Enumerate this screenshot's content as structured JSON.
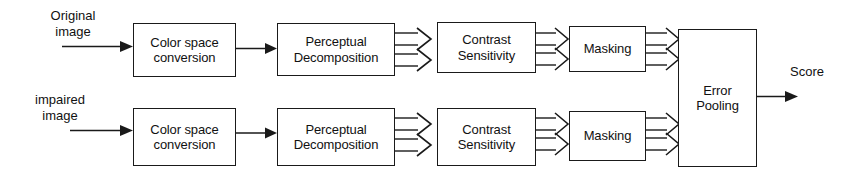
{
  "diagram": {
    "type": "flowchart",
    "background_color": "#ffffff",
    "line_color": "#1a1a1a",
    "text_color": "#111111",
    "inputs": [
      {
        "id": "original",
        "line1": "Original",
        "line2": "image"
      },
      {
        "id": "impaired",
        "line1": "impaired",
        "line2": "image"
      }
    ],
    "output": {
      "id": "score",
      "label": "Score"
    },
    "stages": [
      {
        "id": "color-space-conversion",
        "line1": "Color space",
        "line2": "conversion"
      },
      {
        "id": "perceptual-decomposition",
        "line1": "Perceptual",
        "line2": "Decomposition"
      },
      {
        "id": "contrast-sensitivity",
        "line1": "Contrast",
        "line2": "Sensitivity"
      },
      {
        "id": "masking",
        "line1": "Masking",
        "line2": ""
      }
    ],
    "merge_node": {
      "id": "error-pooling",
      "line1": "Error",
      "line2": "Pooling"
    },
    "rows": [
      {
        "id": "top-row",
        "source": "original",
        "nodes": [
          {
            "id": "top-color-space-conversion",
            "line1": "Color space",
            "line2": "conversion"
          },
          {
            "id": "top-perceptual-decomposition",
            "line1": "Perceptual",
            "line2": "Decomposition"
          },
          {
            "id": "top-contrast-sensitivity",
            "line1": "Contrast",
            "line2": "Sensitivity"
          },
          {
            "id": "top-masking",
            "line1": "Masking",
            "line2": ""
          }
        ]
      },
      {
        "id": "bottom-row",
        "source": "impaired",
        "nodes": [
          {
            "id": "bottom-color-space-conversion",
            "line1": "Color space",
            "line2": "conversion"
          },
          {
            "id": "bottom-perceptual-decomposition",
            "line1": "Perceptual",
            "line2": "Decomposition"
          },
          {
            "id": "bottom-contrast-sensitivity",
            "line1": "Contrast",
            "line2": "Sensitivity"
          },
          {
            "id": "bottom-masking",
            "line1": "Masking",
            "line2": ""
          }
        ]
      }
    ]
  }
}
